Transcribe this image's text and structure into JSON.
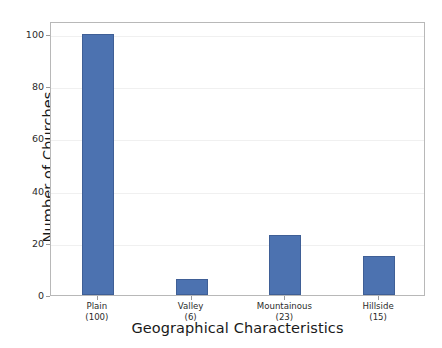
{
  "chart_data": {
    "type": "bar",
    "title": "",
    "xlabel": "Geographical Characteristics",
    "ylabel": "Number of Churches",
    "categories": [
      "Plain",
      "Valley",
      "Mountainous",
      "Hillside"
    ],
    "values": [
      100,
      6,
      23,
      15
    ],
    "tick_labels": [
      {
        "category": "Plain",
        "count": "(100)"
      },
      {
        "category": "Valley",
        "count": "(6)"
      },
      {
        "category": "Mountainous",
        "count": "(23)"
      },
      {
        "category": "Hillside",
        "count": "(15)"
      }
    ],
    "ylim": [
      0,
      105
    ],
    "yticks": [
      0,
      20,
      40,
      60,
      80,
      100
    ],
    "ytick_labels": [
      "0",
      "20",
      "40",
      "60",
      "80",
      "100"
    ],
    "grid": true,
    "grid_axis": "y",
    "legend": null,
    "bar_color": "#4c72b0",
    "bar_edge_color": "#3f5f96",
    "axes_edge_color": "#b8b8b8",
    "grid_color": "#f0f0f0",
    "background": "#ffffff"
  }
}
